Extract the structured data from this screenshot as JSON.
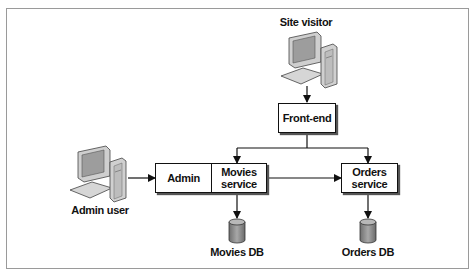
{
  "diagram": {
    "nodes": {
      "site_visitor": {
        "label": "Site visitor",
        "icon": "desktop-computer-icon"
      },
      "front_end": {
        "label": "Front-end"
      },
      "admin_user": {
        "label": "Admin user",
        "icon": "desktop-computer-icon"
      },
      "admin": {
        "label": "Admin"
      },
      "movies_service": {
        "label": "Movies\nservice",
        "line1": "Movies",
        "line2": "service"
      },
      "orders_service": {
        "label": "Orders\nservice",
        "line1": "Orders",
        "line2": "service"
      },
      "movies_db": {
        "label": "Movies DB",
        "icon": "database-cylinder-icon"
      },
      "orders_db": {
        "label": "Orders DB",
        "icon": "database-cylinder-icon"
      }
    },
    "edges": [
      {
        "from": "Site visitor",
        "to": "Front-end"
      },
      {
        "from": "Front-end",
        "to": "Movies service"
      },
      {
        "from": "Front-end",
        "to": "Orders service"
      },
      {
        "from": "Admin user",
        "to": "Admin"
      },
      {
        "from": "Movies service",
        "to": "Orders service"
      },
      {
        "from": "Movies service",
        "to": "Movies DB"
      },
      {
        "from": "Orders service",
        "to": "Orders DB"
      }
    ],
    "colors": {
      "stroke": "#111111",
      "frame": "#9a9a9a",
      "db_fill": "#8c8c8c",
      "computer_fill": "#b5b5b5"
    }
  }
}
